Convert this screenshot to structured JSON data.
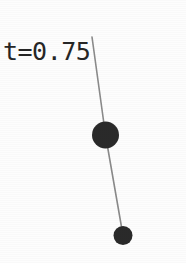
{
  "figure": {
    "background_color": "#fdfdfd",
    "width": 186,
    "height": 263,
    "time_label": "t=0.75",
    "label_color": "#262626",
    "ink_color": "#2b2b2b",
    "rod_color": "#8a8a8a",
    "reference_line_color": "#a6a6a6"
  },
  "chart_data": {
    "type": "scatter",
    "title": "t=0.75",
    "xlabel": "",
    "ylabel": "",
    "xlim": [
      0,
      186
    ],
    "ylim": [
      263,
      0
    ],
    "grid": false,
    "legend": "none",
    "annotations": [
      {
        "name": "time-label",
        "text": "t=0.75",
        "x": 4,
        "y": 52
      }
    ],
    "reference_lines": [
      {
        "name": "horizontal-dotted-axis",
        "orientation": "horizontal",
        "y": 36.5,
        "x_start": 0,
        "x_end": 186,
        "style": "dotted",
        "color": "#a6a6a6",
        "width": 1
      }
    ],
    "series": [
      {
        "name": "pivot",
        "points": [
          {
            "x": 92,
            "y": 37
          }
        ],
        "marker": "none",
        "radius": 0,
        "color": "#2b2b2b"
      },
      {
        "name": "bob-1",
        "points": [
          {
            "x": 105.5,
            "y": 135
          }
        ],
        "marker": "circle",
        "radius": 13.5,
        "color": "#2b2b2b"
      },
      {
        "name": "bob-2",
        "points": [
          {
            "x": 123,
            "y": 235.5
          }
        ],
        "marker": "circle",
        "radius": 9.5,
        "color": "#2b2b2b"
      }
    ],
    "links": [
      {
        "name": "rod-1",
        "from": {
          "x": 92,
          "y": 37
        },
        "to": {
          "x": 105.5,
          "y": 135
        },
        "color": "#8a8a8a",
        "width": 1.6
      },
      {
        "name": "rod-2",
        "from": {
          "x": 105.5,
          "y": 135
        },
        "to": {
          "x": 123,
          "y": 235.5
        },
        "color": "#8a8a8a",
        "width": 1.6
      }
    ]
  }
}
